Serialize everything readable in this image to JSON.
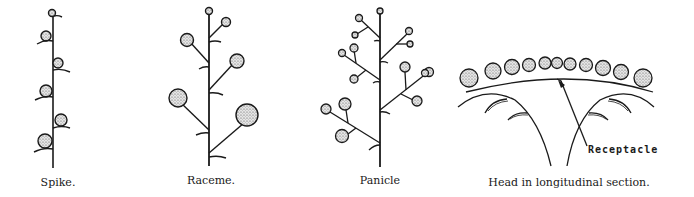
{
  "figure": {
    "panels": [
      {
        "id": "spike",
        "caption": "Spike.",
        "caption_x": 58,
        "caption_y": 180
      },
      {
        "id": "raceme",
        "caption": "Raceme.",
        "caption_x": 211,
        "caption_y": 178
      },
      {
        "id": "panicle",
        "caption": "Panicle",
        "caption_x": 380,
        "caption_y": 178
      },
      {
        "id": "head",
        "caption": "Head in longitudinal section.",
        "caption_x": 569,
        "caption_y": 180
      }
    ],
    "annotations": {
      "receptacle_label": "Receptacle"
    },
    "colors": {
      "ink": "#1a1a1a",
      "flower_fill": "#d9d9d9",
      "background": "#ffffff"
    }
  }
}
